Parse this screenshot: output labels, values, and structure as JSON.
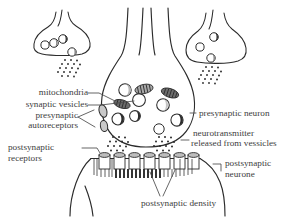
{
  "figure": {
    "kind": "biological-diagram",
    "background_color": "#ffffff",
    "ink_color": "#2b2b2b",
    "text_color": "#3d3d3d"
  },
  "labels": {
    "mitochondria": "mitochondria",
    "synaptic_vesicles": "synaptic vesicles",
    "presynaptic": "presynaptic",
    "autoreceptors": "autoreceptors",
    "postsynaptic": "postsynaptic",
    "receptors": "receptors",
    "presynaptic_neuron": "presynaptic neuron",
    "neurotransmitter": "neurotransmitter",
    "released_from_vessicles": "released from vessicles",
    "postsynaptic_2": "postsynaptic",
    "neurone": "neurone",
    "postsynaptic_density": "postsynaptic density"
  },
  "structures": {
    "presynaptic_terminal_main": "presynaptic terminal bouton (center)",
    "presynaptic_terminal_left": "adjacent terminal bouton (upper left)",
    "presynaptic_terminal_right": "adjacent terminal bouton (upper right)",
    "vesicle_count_main": 7,
    "mitochondria_count_main": 4,
    "autoreceptor_count": 2,
    "receptor_count": 7,
    "neurotransmitter_clouds": 4
  }
}
